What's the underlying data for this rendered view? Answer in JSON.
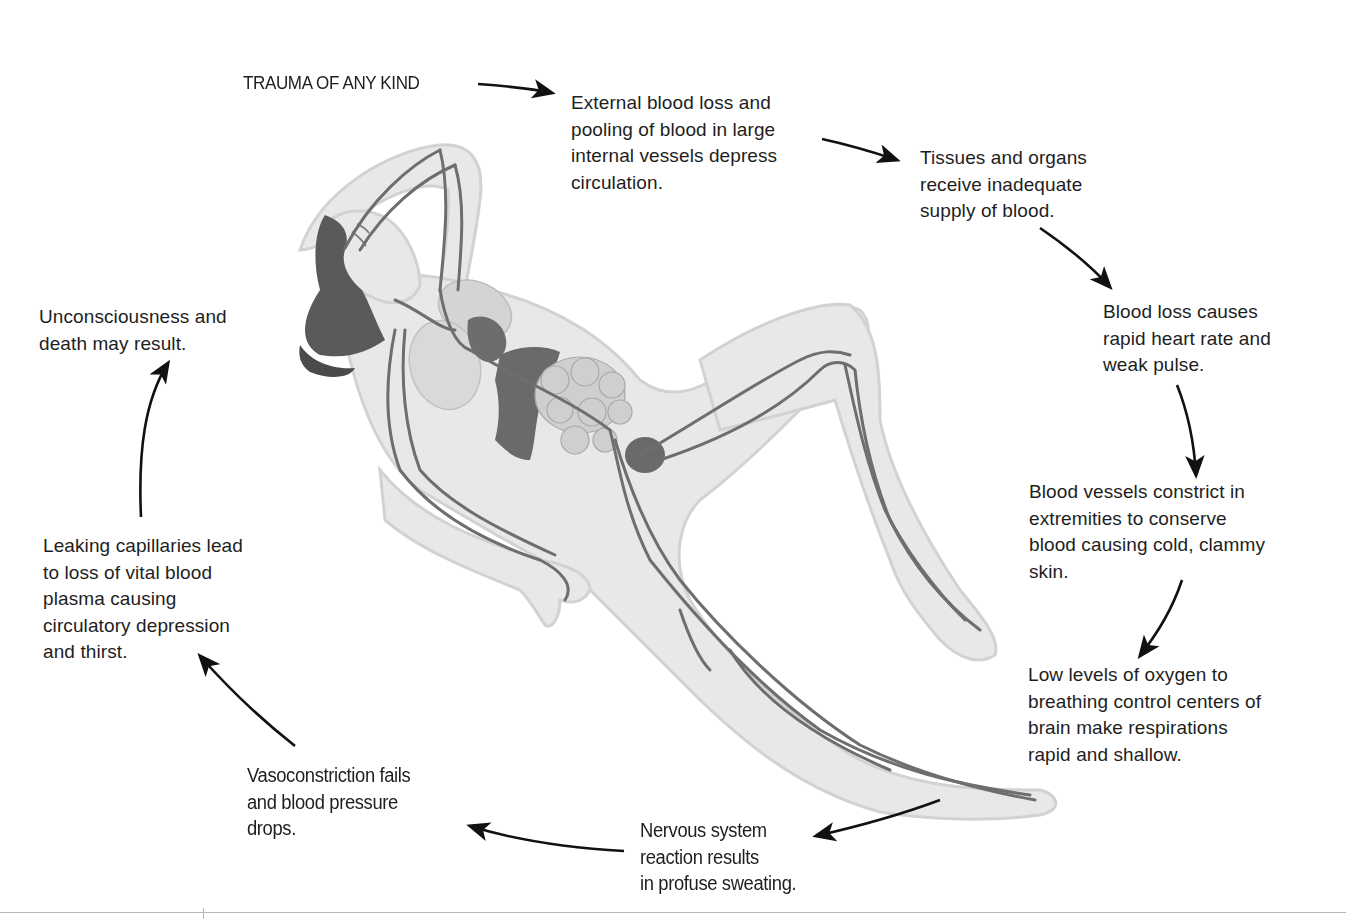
{
  "diagram": {
    "start_label": "TRAUMA OF ANY KIND",
    "steps": [
      {
        "id": "step-1",
        "text": "External blood loss and\npooling of blood in large\ninternal vessels depress\ncirculation."
      },
      {
        "id": "step-2",
        "text": "Tissues and organs\nreceive inadequate\nsupply of blood."
      },
      {
        "id": "step-3",
        "text": "Blood loss causes\nrapid heart rate and\nweak pulse."
      },
      {
        "id": "step-4",
        "text": "Blood vessels constrict in\nextremities to conserve\nblood causing cold, clammy\nskin."
      },
      {
        "id": "step-5",
        "text": "Low levels of oxygen to\nbreathing control centers of\nbrain make respirations\nrapid and shallow."
      },
      {
        "id": "step-6",
        "text": "Nervous system\nreaction results\nin profuse sweating."
      },
      {
        "id": "step-7",
        "text": "Vasoconstriction fails\nand blood pressure\ndrops."
      },
      {
        "id": "step-8",
        "text": "Leaking capillaries lead\nto loss of vital blood\nplasma causing\ncirculatory depression\nand thirst."
      },
      {
        "id": "step-9",
        "text": "Unconsciousness and\ndeath may result."
      }
    ],
    "illustration": {
      "subject": "reclining-human-figure",
      "highlights": [
        "blood-vessels",
        "heart",
        "lungs",
        "liver",
        "intestines",
        "bladder"
      ]
    },
    "colors": {
      "text": "#1e1e1e",
      "arrow": "#111111",
      "body_fill": "#e6e6e6",
      "body_outline": "#cfcfcf",
      "vessel": "#6e6e6e",
      "organ_dark": "#6a6a6a",
      "organ_light": "#c9c9c9",
      "hair": "#555555"
    }
  }
}
